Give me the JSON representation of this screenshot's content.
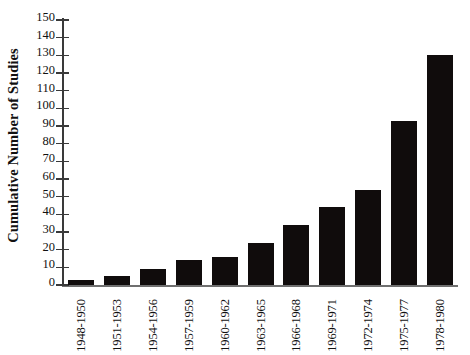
{
  "chart_data": {
    "type": "bar",
    "title": "",
    "xlabel": "",
    "ylabel": "Cumulative Number of Studies",
    "ylim": [
      0,
      150
    ],
    "ytick_step": 10,
    "yticks": [
      150,
      140,
      130,
      120,
      110,
      100,
      90,
      80,
      70,
      60,
      50,
      40,
      30,
      20,
      10,
      0
    ],
    "grid": false,
    "legend": "none",
    "bar_color": "#100c0c",
    "axis_color": "#3a3a3a",
    "categories": [
      "1948-1950",
      "1951-1953",
      "1954-1956",
      "1957-1959",
      "1960-1962",
      "1963-1965",
      "1966-1968",
      "1969-1971",
      "1972-1974",
      "1975-1977",
      "1978-1980"
    ],
    "values": [
      3,
      5,
      9,
      14,
      16,
      24,
      34,
      44,
      54,
      93,
      130
    ]
  }
}
